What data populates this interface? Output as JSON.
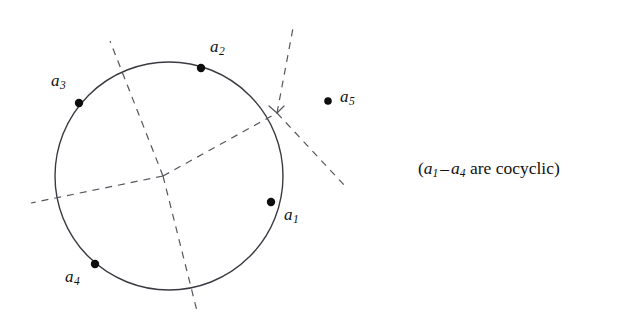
{
  "figure": {
    "background_color": "#ffffff",
    "stroke_color": "#3a3a42",
    "point_color": "#0d0d0d",
    "text_color": "#111111",
    "width": 629,
    "height": 322
  },
  "circle": {
    "center_x": 169,
    "center_y": 176,
    "radius": 114,
    "stroke_width": 1.4,
    "dashed": false
  },
  "points": [
    {
      "id": "a1",
      "label_base": "a",
      "label_sub": "1",
      "x": 271,
      "y": 202,
      "label_x": 284,
      "label_y": 206,
      "on_circle": true,
      "radius": 4.2
    },
    {
      "id": "a2",
      "label_base": "a",
      "label_sub": "2",
      "x": 201,
      "y": 68,
      "label_x": 210,
      "label_y": 38,
      "on_circle": true,
      "radius": 4.2
    },
    {
      "id": "a3",
      "label_base": "a",
      "label_sub": "3",
      "x": 79,
      "y": 103,
      "label_x": 51,
      "label_y": 72,
      "on_circle": true,
      "radius": 4.2
    },
    {
      "id": "a4",
      "label_base": "a",
      "label_sub": "4",
      "x": 95,
      "y": 264,
      "label_x": 65,
      "label_y": 268,
      "on_circle": true,
      "radius": 4.2
    },
    {
      "id": "a5",
      "label_base": "a",
      "label_sub": "5",
      "x": 328,
      "y": 101,
      "label_x": 340,
      "label_y": 88,
      "on_circle": false,
      "radius": 3.8
    }
  ],
  "junctions": [
    {
      "id": "center-junction",
      "x": 163,
      "y": 176
    },
    {
      "id": "right-junction",
      "x": 277,
      "y": 113
    }
  ],
  "dashed_lines": [
    {
      "id": "branch-up-left",
      "x1": 163,
      "y1": 176,
      "x2": 110,
      "y2": 41
    },
    {
      "id": "branch-down-right",
      "x1": 163,
      "y1": 176,
      "x2": 197,
      "y2": 311
    },
    {
      "id": "branch-left",
      "x1": 163,
      "y1": 176,
      "x2": 31,
      "y2": 203
    },
    {
      "id": "branch-to-right-junction",
      "x1": 163,
      "y1": 176,
      "x2": 277,
      "y2": 113
    },
    {
      "id": "branch-up-right",
      "x1": 277,
      "y1": 113,
      "x2": 293,
      "y2": 28
    },
    {
      "id": "branch-far-right",
      "x1": 277,
      "y1": 113,
      "x2": 345,
      "y2": 186
    }
  ],
  "dash_style": {
    "dasharray": "7 6",
    "stroke_width": 1.2
  },
  "caption": {
    "open_paren": "(",
    "term1_base": "a",
    "term1_sub": "1",
    "dash": "–",
    "term2_base": "a",
    "term2_sub": "4",
    "text_tail": " are cocyclic",
    "close_paren": ")"
  }
}
